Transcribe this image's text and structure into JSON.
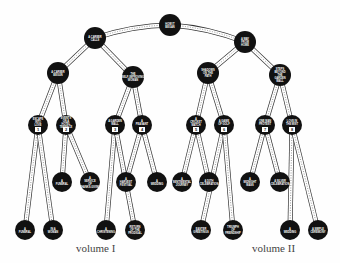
{
  "diagram": {
    "type": "binary-tree",
    "root": {
      "label": "How It Began",
      "x": 170,
      "y": 25
    },
    "nodes": [
      {
        "id": "root",
        "label": "HOW IT BEGAN",
        "x": 170,
        "y": 25,
        "r": 11
      },
      {
        "id": "a",
        "label": "A CAREER CALLS",
        "x": 95,
        "y": 38,
        "r": 11
      },
      {
        "id": "b",
        "label": "A WAY FROM HOME",
        "x": 245,
        "y": 42,
        "r": 11
      },
      {
        "id": "a1",
        "label": "A CAREER BEGUN",
        "x": 58,
        "y": 73,
        "r": 11
      },
      {
        "id": "a2",
        "label": "THE SELF-IMPROVING WOMAN",
        "x": 133,
        "y": 77,
        "r": 11
      },
      {
        "id": "b1",
        "label": "SHADOWS ON THE PATH",
        "x": 208,
        "y": 73,
        "r": 11
      },
      {
        "id": "b2",
        "label": "STEPS BEYOND THE GARDEN WALL",
        "x": 280,
        "y": 75,
        "r": 11
      },
      {
        "id": "n1",
        "label": "ESCAPE INTO LOVE",
        "x": 38,
        "y": 125,
        "r": 10,
        "num": "1"
      },
      {
        "id": "n2",
        "label": "EVENTS ON A HOTEL TERRACE",
        "x": 66,
        "y": 125,
        "r": 10,
        "num": "2"
      },
      {
        "id": "n3",
        "label": "A GARDEN WALL",
        "x": 115,
        "y": 125,
        "r": 10,
        "num": "3"
      },
      {
        "id": "n4",
        "label": "A PEASANT",
        "x": 142,
        "y": 125,
        "r": 10,
        "num": "4"
      },
      {
        "id": "n5",
        "label": "A CRICKET MATCH",
        "x": 196,
        "y": 125,
        "r": 10,
        "num": "5"
      },
      {
        "id": "n6",
        "label": "A GAME OF GOLF",
        "x": 224,
        "y": 125,
        "r": 10,
        "num": "6"
      },
      {
        "id": "n7",
        "label": "ONE MAN PROTEST",
        "x": 265,
        "y": 125,
        "r": 10,
        "num": "7"
      },
      {
        "id": "n8",
        "label": "LOVE IN THE MIST",
        "x": 292,
        "y": 125,
        "r": 10,
        "num": "8"
      },
      {
        "id": "l4a",
        "label": "A FUNERAL",
        "x": 62,
        "y": 182,
        "r": 10
      },
      {
        "id": "l4b",
        "label": "A SERVICE OF THANKS-GIVING",
        "x": 90,
        "y": 182,
        "r": 10
      },
      {
        "id": "l4c",
        "label": "A HARVEST FESTIVAL",
        "x": 126,
        "y": 182,
        "r": 10
      },
      {
        "id": "l4d",
        "label": "A WEDDING",
        "x": 157,
        "y": 182,
        "r": 10
      },
      {
        "id": "l4e",
        "label": "A SENTIMENTAL JOURNEY",
        "x": 182,
        "y": 182,
        "r": 10
      },
      {
        "id": "l4f",
        "label": "A 50TH CELEBRATION",
        "x": 209,
        "y": 182,
        "r": 10
      },
      {
        "id": "l4g",
        "label": "A MIDNIGHT MASS",
        "x": 250,
        "y": 182,
        "r": 10
      },
      {
        "id": "l4h",
        "label": "A SILVER CELEBRATION",
        "x": 280,
        "y": 182,
        "r": 10
      },
      {
        "id": "l5a",
        "label": "A FUNERAL",
        "x": 25,
        "y": 230,
        "r": 10
      },
      {
        "id": "l5b",
        "label": "IN A WOMAN",
        "x": 53,
        "y": 230,
        "r": 10
      },
      {
        "id": "l5c",
        "label": "A CHRISTENING",
        "x": 106,
        "y": 230,
        "r": 10
      },
      {
        "id": "l5d",
        "label": "RETURN OF THE PRODIGAL",
        "x": 135,
        "y": 230,
        "r": 10
      },
      {
        "id": "l5e",
        "label": "EASTER GREETINGS",
        "x": 201,
        "y": 230,
        "r": 10
      },
      {
        "id": "l5f",
        "label": "TRIUMPH OF FRIENDSHIP",
        "x": 233,
        "y": 230,
        "r": 10
      },
      {
        "id": "l5g",
        "label": "A WEDDING",
        "x": 290,
        "y": 230,
        "r": 10
      },
      {
        "id": "l5h",
        "label": "A SIMPLE CEREMONY",
        "x": 318,
        "y": 230,
        "r": 10
      }
    ],
    "edges": [
      [
        "root",
        "a"
      ],
      [
        "root",
        "b"
      ],
      [
        "a",
        "a1"
      ],
      [
        "a",
        "a2"
      ],
      [
        "b",
        "b1"
      ],
      [
        "b",
        "b2"
      ],
      [
        "a1",
        "n1"
      ],
      [
        "a1",
        "n2"
      ],
      [
        "a2",
        "n3"
      ],
      [
        "a2",
        "n4"
      ],
      [
        "b1",
        "n5"
      ],
      [
        "b1",
        "n6"
      ],
      [
        "b2",
        "n7"
      ],
      [
        "b2",
        "n8"
      ],
      [
        "n2",
        "l4a"
      ],
      [
        "n2",
        "l4b"
      ],
      [
        "n4",
        "l4c"
      ],
      [
        "n4",
        "l4d"
      ],
      [
        "n5",
        "l4e"
      ],
      [
        "n5",
        "l4f"
      ],
      [
        "n7",
        "l4g"
      ],
      [
        "n7",
        "l4h"
      ],
      [
        "n1",
        "l5a"
      ],
      [
        "n1",
        "l5b"
      ],
      [
        "n3",
        "l5c"
      ],
      [
        "n3",
        "l5d"
      ],
      [
        "n6",
        "l5e"
      ],
      [
        "n6",
        "l5f"
      ],
      [
        "n8",
        "l5g"
      ],
      [
        "n8",
        "l5h"
      ]
    ],
    "colors": {
      "node": "#111111",
      "edge_fill": "#ffffff",
      "edge_stroke": "#333333",
      "text": "#ffffff"
    }
  },
  "labels": {
    "volume1": "volume I",
    "volume2": "volume II"
  }
}
